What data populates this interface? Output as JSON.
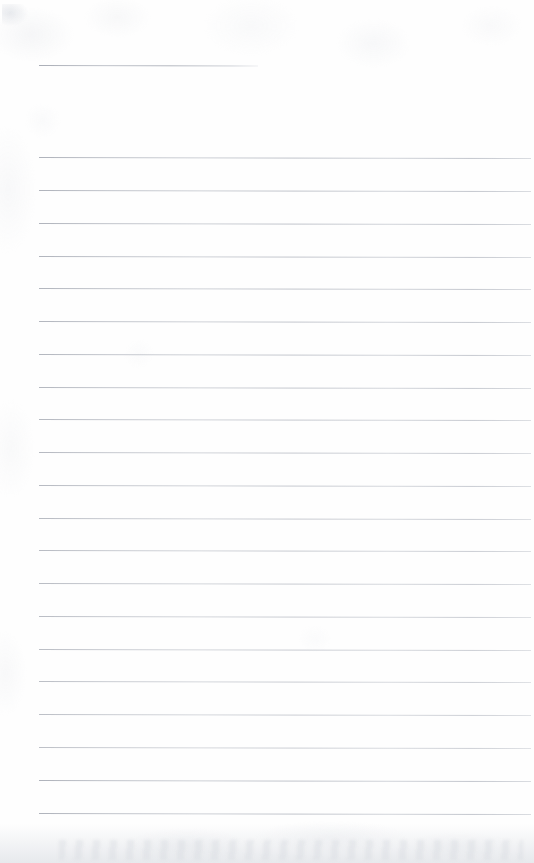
{
  "document": {
    "kind": "scanned-lined-notebook-page",
    "title": "",
    "page_label": "",
    "background_color": "#fefefe",
    "rule_color": "#a8acb5",
    "width_px": 534,
    "height_px": 863,
    "has_handwriting": false,
    "has_printed_text": false,
    "visible_text": ""
  },
  "layout": {
    "left_margin_px": 39,
    "right_edge_px": 531,
    "line_spacing_px": 32.9,
    "skew_degrees": 0.13
  },
  "header_rule": {
    "label": "title-rule",
    "x": 39,
    "y": 65,
    "width": 219
  },
  "rules": [
    {
      "index": 1,
      "y": 157,
      "x": 39,
      "width": 492
    },
    {
      "index": 2,
      "y": 190,
      "x": 39,
      "width": 492
    },
    {
      "index": 3,
      "y": 223,
      "x": 39,
      "width": 492
    },
    {
      "index": 4,
      "y": 256,
      "x": 39,
      "width": 492
    },
    {
      "index": 5,
      "y": 288,
      "x": 39,
      "width": 492
    },
    {
      "index": 6,
      "y": 321,
      "x": 39,
      "width": 492
    },
    {
      "index": 7,
      "y": 354,
      "x": 39,
      "width": 492
    },
    {
      "index": 8,
      "y": 387,
      "x": 39,
      "width": 492
    },
    {
      "index": 9,
      "y": 419,
      "x": 39,
      "width": 492
    },
    {
      "index": 10,
      "y": 452,
      "x": 39,
      "width": 492
    },
    {
      "index": 11,
      "y": 485,
      "x": 39,
      "width": 492
    },
    {
      "index": 12,
      "y": 518,
      "x": 39,
      "width": 492
    },
    {
      "index": 13,
      "y": 550,
      "x": 39,
      "width": 492
    },
    {
      "index": 14,
      "y": 583,
      "x": 39,
      "width": 492
    },
    {
      "index": 15,
      "y": 616,
      "x": 39,
      "width": 492
    },
    {
      "index": 16,
      "y": 649,
      "x": 39,
      "width": 492
    },
    {
      "index": 17,
      "y": 681,
      "x": 39,
      "width": 492
    },
    {
      "index": 18,
      "y": 714,
      "x": 39,
      "width": 492
    },
    {
      "index": 19,
      "y": 747,
      "x": 39,
      "width": 492
    },
    {
      "index": 20,
      "y": 780,
      "x": 39,
      "width": 492
    },
    {
      "index": 21,
      "y": 813,
      "x": 39,
      "width": 492
    }
  ]
}
